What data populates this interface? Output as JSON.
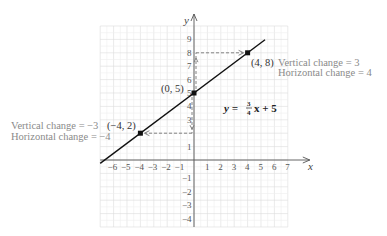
{
  "chart_data": {
    "type": "line",
    "title": "",
    "xlabel": "x",
    "ylabel": "y",
    "xlim": [
      -7,
      7
    ],
    "ylim": [
      -5,
      10
    ],
    "grid": true,
    "x_ticks": [
      "-6",
      "-5",
      "-4",
      "-3",
      "-2",
      "-1",
      "1",
      "2",
      "3",
      "4",
      "5",
      "6",
      "7"
    ],
    "y_ticks": [
      "9",
      "8",
      "7",
      "6",
      "5",
      "4",
      "3",
      "1",
      "-1",
      "-2",
      "-3",
      "-4"
    ],
    "series": [
      {
        "name": "y = 3/4 x + 5",
        "slope": 0.75,
        "intercept": 5,
        "x_range": [
          -7,
          5.3
        ]
      }
    ],
    "points": [
      {
        "label": "(0, 5)",
        "x": 0,
        "y": 5
      },
      {
        "label": "(4, 8)",
        "x": 4,
        "y": 8
      },
      {
        "label": "(-4, 2)",
        "x": -4,
        "y": 2
      }
    ],
    "equation_label": {
      "lhs": "y =",
      "num": "3",
      "den": "4",
      "rhs": "x + 5"
    },
    "annotations": [
      {
        "id": "upper",
        "lines": [
          "Vertical change = 3",
          "Horizontal change = 4"
        ]
      },
      {
        "id": "lower",
        "lines": [
          "Vertical change = −3",
          "Horizontal change = −4"
        ]
      }
    ]
  },
  "labels": {
    "x_axis": "x",
    "y_axis": "y",
    "p0": "(0, 5)",
    "p1": "(4, 8)",
    "p2": "(−4, 2)",
    "upper_v": "Vertical change = 3",
    "upper_h": "Horizontal change = 4",
    "lower_v": "Vertical change = −3",
    "lower_h": "Horizontal change = −4",
    "eq_lhs": "y =",
    "eq_num": "3",
    "eq_den": "4",
    "eq_rhs": "x + 5"
  },
  "colors": {
    "grid": "#dcdcdc",
    "grid_minor": "#eeeeee",
    "axis": "#555555",
    "line": "#111111",
    "dash": "#777777",
    "annotation": "#8a8a8a"
  }
}
